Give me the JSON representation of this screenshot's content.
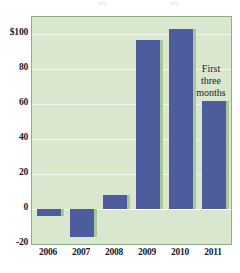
{
  "chart_data": {
    "type": "bar",
    "title": "",
    "subtitle": "",
    "xlabel": "",
    "ylabel": "",
    "categories": [
      "2006",
      "2007",
      "2008",
      "2009",
      "2010",
      "2011"
    ],
    "values": [
      -4,
      -16,
      8,
      97,
      103,
      62
    ],
    "ylim": [
      -20,
      110
    ],
    "yticks": [
      -20,
      0,
      20,
      40,
      60,
      80,
      100
    ],
    "ytick_labels": [
      "-20",
      "0",
      "20",
      "40",
      "60",
      "80",
      "$100"
    ],
    "grid": true,
    "legend": false,
    "legend_position": "none",
    "annotations": [
      {
        "target_category": "2011",
        "lines": [
          "First",
          "three",
          "months"
        ]
      }
    ],
    "colors": {
      "bar": "#4c5c9d",
      "bar_shadow": "#a9c79c",
      "plot_background": "#d8e7ce",
      "plot_border": "#8fae86",
      "gridline": "#f2f7ee",
      "zeroline": "#ffffff",
      "text": "#19192a",
      "page_background": "#ffffff"
    }
  }
}
